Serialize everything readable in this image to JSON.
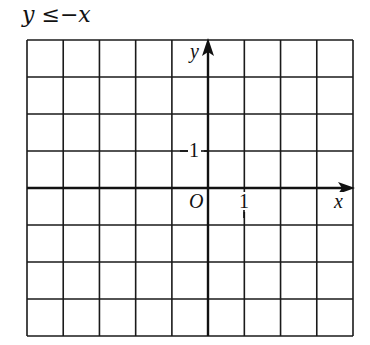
{
  "title": {
    "lhs": "y",
    "operator": "≤",
    "rhs": "−x"
  },
  "graph": {
    "axis_labels": {
      "x": "x",
      "y": "y",
      "origin": "O"
    },
    "tick_labels": {
      "x_one": "1",
      "y_one": "1"
    },
    "grid": {
      "columns": 9,
      "rows": 8,
      "x_axis_row": 4,
      "y_axis_col": 5
    },
    "colors": {
      "line": "#1a1a1a",
      "background": "#ffffff"
    }
  }
}
